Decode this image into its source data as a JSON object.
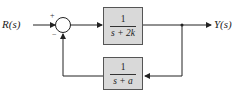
{
  "diagram": {
    "input_label": "R(s)",
    "output_label": "Y(s)",
    "summing_junction": {
      "plus_sign": "+",
      "minus_sign": "−"
    },
    "forward_block": {
      "numerator": "1",
      "denominator": "s + 2k"
    },
    "feedback_block": {
      "numerator": "1",
      "denominator": "s + a"
    },
    "colors": {
      "block_fill": "#d9d9d9",
      "line": "#222222"
    }
  }
}
